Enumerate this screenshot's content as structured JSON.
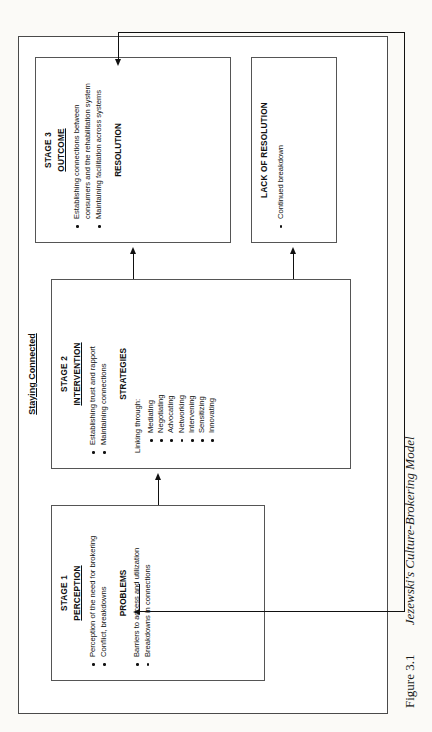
{
  "figure": {
    "number": "Figure 3.1",
    "title": "Jezewski's Culture-Brokering Model"
  },
  "intervening_conditions": {
    "title": "INTERVENING CONDITIONS",
    "column_left": [
      "Type of disability and cause",
      "Communication",
      "Age",
      "Culture sensitivity",
      "Time",
      "Cultural background"
    ],
    "column_right": [
      "Power/powerlessness",
      "Economics",
      "Bureaucracy",
      "Politics",
      "Network",
      "Stigma"
    ]
  },
  "band_label": "Staying Connected",
  "stage1": {
    "stage": "STAGE 1",
    "heading": "PERCEPTION",
    "items": [
      "Perception of the need for brokering",
      "Conflict, breakdowns"
    ],
    "sub_heading": "PROBLEMS",
    "sub_items": [
      "Barriers to access and utilization",
      "Breakdowns in connections"
    ]
  },
  "stage2": {
    "stage": "STAGE 2",
    "heading": "INTERVENTION",
    "items": [
      "Establishing trust and rapport",
      "Maintaining connections"
    ],
    "sub_heading": "STRATEGIES",
    "lead_in": "Linking through:",
    "strategies": [
      "Mediating",
      "Negotiating",
      "Advocating",
      "Networking",
      "Intervening",
      "Sensitizing",
      "Innovating"
    ]
  },
  "stage3": {
    "stage": "STAGE 3",
    "heading": "OUTCOME",
    "items": [
      "Establishing connections between consumers and the rehabilitation system",
      "Maintaining facilitation across systems"
    ],
    "sub_heading": "RESOLUTION"
  },
  "lack_of_resolution": {
    "heading": "LACK OF RESOLUTION",
    "items": [
      "Continued breakdown"
    ]
  },
  "colors": {
    "ink": "#111111",
    "rule": "#555555",
    "page": "#fbfaf7"
  }
}
